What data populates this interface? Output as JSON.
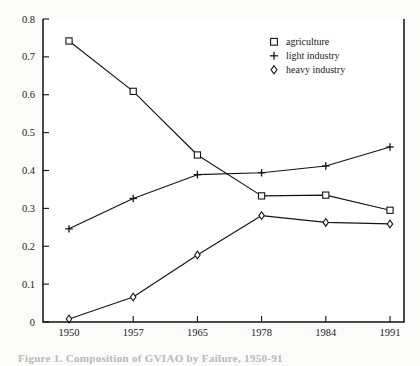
{
  "chart_data": {
    "type": "line",
    "title": "",
    "xlabel": "",
    "ylabel": "",
    "categories": [
      "1950",
      "1957",
      "1965",
      "1978",
      "1984",
      "1991"
    ],
    "ylim": [
      0,
      0.8
    ],
    "yticks": [
      "0",
      "0.1",
      "0.2",
      "0.3",
      "0.4",
      "0.5",
      "0.6",
      "0.7",
      "0.8"
    ],
    "ytick_values": [
      0,
      0.1,
      0.2,
      0.3,
      0.4,
      0.5,
      0.6,
      0.7,
      0.8
    ],
    "grid": "off",
    "legend_position": "top-right inside plot",
    "series": [
      {
        "name": "agriculture",
        "marker": "open-square",
        "values": [
          0.742,
          0.609,
          0.441,
          0.333,
          0.335,
          0.295
        ]
      },
      {
        "name": "light industry",
        "marker": "plus",
        "values": [
          0.246,
          0.326,
          0.389,
          0.394,
          0.412,
          0.462
        ]
      },
      {
        "name": "heavy industry",
        "marker": "open-diamond",
        "values": [
          0.008,
          0.066,
          0.177,
          0.281,
          0.263,
          0.259
        ]
      }
    ]
  },
  "legend": {
    "entries": [
      {
        "label": "agriculture",
        "marker": "open-square"
      },
      {
        "label": "light industry",
        "marker": "plus"
      },
      {
        "label": "heavy industry",
        "marker": "open-diamond"
      }
    ]
  },
  "caption": {
    "text": "Figure 1.  Composition of GVIAO by Failure, 1950-91"
  },
  "colors": {
    "ink": "#141414",
    "plot_background": "#ffffff",
    "page_background": "#fbfbfa"
  }
}
